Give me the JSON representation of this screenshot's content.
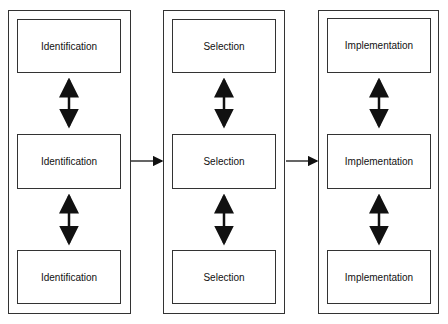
{
  "columns": [
    {
      "name": "identification",
      "boxes": [
        "Identification",
        "Identification",
        "Identification"
      ]
    },
    {
      "name": "selection",
      "boxes": [
        "Selection",
        "Selection",
        "Selection"
      ]
    },
    {
      "name": "implementation",
      "boxes": [
        "Implementation",
        "Implementation",
        "Implementation"
      ]
    }
  ],
  "connectors": {
    "vertical": "double-headed arrows between stacked boxes",
    "horizontal": "single arrows from column 1 to 2 and 2 to 3"
  },
  "colors": {
    "stroke": "#333333",
    "background": "#ffffff"
  }
}
